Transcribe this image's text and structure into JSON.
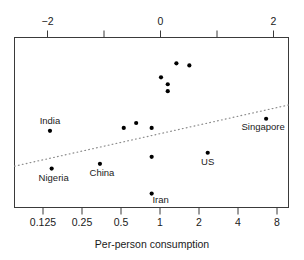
{
  "chart_data": {
    "type": "scatter",
    "title": "",
    "xlabel": "Per-person consumption",
    "ylabel": "",
    "top_axis": {
      "label": "",
      "ticks": [
        -2,
        -1,
        0,
        1,
        2
      ],
      "tick_labels": [
        "−2",
        "",
        "0",
        "",
        "2"
      ],
      "range": [
        -2.6,
        2.4
      ]
    },
    "bottom_axis": {
      "label": "Per-person consumption",
      "scale": "log2",
      "ticks": [
        0.125,
        0.25,
        0.5,
        1,
        2,
        4,
        8
      ],
      "tick_labels": [
        "0.125",
        "0.25",
        "0.5",
        "1",
        "2",
        "4",
        "8"
      ],
      "range": [
        0.088,
        11.3
      ]
    },
    "grid": false,
    "legend": false,
    "trendline": {
      "style": "dotted",
      "x_start": 0.088,
      "x_end": 11.3,
      "y_start": 0.243,
      "y_end": 0.603
    },
    "points": [
      {
        "label": "India",
        "x": 0.165,
        "y": 0.451
      },
      {
        "label": "Nigeria",
        "x": 0.17,
        "y": 0.229
      },
      {
        "label": "China",
        "x": 0.4,
        "y": 0.257
      },
      {
        "label": "Iran",
        "x": 1.0,
        "y": 0.082
      },
      {
        "label": "US",
        "x": 2.7,
        "y": 0.322
      },
      {
        "label": "Singapore",
        "x": 7.6,
        "y": 0.522
      },
      {
        "label": "",
        "x": 0.61,
        "y": 0.468
      },
      {
        "label": "",
        "x": 0.76,
        "y": 0.497
      },
      {
        "label": "",
        "x": 1.0,
        "y": 0.468
      },
      {
        "label": "",
        "x": 1.0,
        "y": 0.298
      },
      {
        "label": "",
        "x": 1.18,
        "y": 0.766
      },
      {
        "label": "",
        "x": 1.33,
        "y": 0.725
      },
      {
        "label": "",
        "x": 1.33,
        "y": 0.684
      },
      {
        "label": "",
        "x": 1.55,
        "y": 0.848
      },
      {
        "label": "",
        "x": 1.95,
        "y": 0.836
      }
    ],
    "point_labels": [
      "India",
      "Nigeria",
      "China",
      "Iran",
      "US",
      "Singapore"
    ],
    "colors": {
      "point": "#000000",
      "frame": "#3a3a3a",
      "trendline": "#8c8c8c",
      "text": "#1a1a1a",
      "background": "#ffffff"
    }
  },
  "axes": {
    "top_tick_labels": [
      "−2",
      "0",
      "2"
    ],
    "bottom_tick_labels": [
      "0.125",
      "0.25",
      "0.5",
      "1",
      "2",
      "4",
      "8"
    ],
    "x_axis_title": "Per-person consumption"
  },
  "labels": {
    "india": "India",
    "nigeria": "Nigeria",
    "china": "China",
    "iran": "Iran",
    "us": "US",
    "singapore": "Singapore"
  }
}
